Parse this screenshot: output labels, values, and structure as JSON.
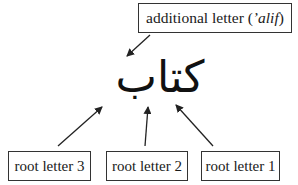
{
  "diagram": {
    "word": "كتاب",
    "top_label": {
      "prefix": "additional letter (",
      "italic": "’alif",
      "suffix": ")"
    },
    "root_labels": [
      {
        "id": "root3",
        "text": "root letter 3"
      },
      {
        "id": "root2",
        "text": "root letter 2"
      },
      {
        "id": "root1",
        "text": "root letter 1"
      }
    ],
    "colors": {
      "line": "#222222",
      "border": "#333333",
      "background": "#ffffff"
    }
  }
}
